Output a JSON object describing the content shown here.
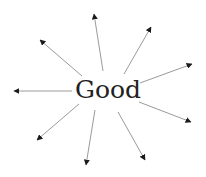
{
  "diagram": {
    "type": "radial-word-map",
    "center_word": "Good",
    "colors": {
      "text": "#222222",
      "line": "#9a9a9a",
      "arrowhead": "#1a1a1a",
      "background": "#ffffff"
    },
    "arrows": [
      {
        "name": "arrow-up",
        "x1": 103,
        "y1": 71,
        "x2": 94,
        "y2": 14
      },
      {
        "name": "arrow-up-right",
        "x1": 124,
        "y1": 74,
        "x2": 151,
        "y2": 27
      },
      {
        "name": "arrow-right-up",
        "x1": 140,
        "y1": 83,
        "x2": 192,
        "y2": 64
      },
      {
        "name": "arrow-right-down",
        "x1": 139,
        "y1": 102,
        "x2": 191,
        "y2": 122
      },
      {
        "name": "arrow-down-right",
        "x1": 118,
        "y1": 112,
        "x2": 145,
        "y2": 160
      },
      {
        "name": "arrow-down",
        "x1": 95,
        "y1": 110,
        "x2": 86,
        "y2": 165
      },
      {
        "name": "arrow-down-left",
        "x1": 79,
        "y1": 104,
        "x2": 37,
        "y2": 140
      },
      {
        "name": "arrow-left",
        "x1": 72,
        "y1": 91,
        "x2": 14,
        "y2": 91
      },
      {
        "name": "arrow-up-left",
        "x1": 82,
        "y1": 76,
        "x2": 40,
        "y2": 40
      }
    ]
  }
}
